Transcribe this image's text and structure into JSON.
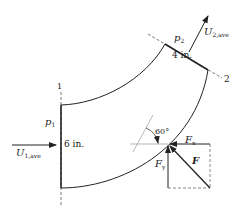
{
  "diagram": {
    "section1_label": "1",
    "section2_label": "2",
    "p1": "p",
    "p1_sub": "1",
    "p2": "p",
    "p2_sub": "2",
    "inlet_dim": "6 in.",
    "outlet_dim": "4 in.",
    "u1": "U",
    "u1_sub": "1,ave",
    "u2": "U",
    "u2_sub": "2,ave",
    "angle": "60°",
    "fx": "F",
    "fx_sub": "x",
    "fy": "F",
    "fy_sub": "y",
    "f": "F"
  },
  "colors": {
    "line": "#222222",
    "dashed": "#555555",
    "thin": "#888888"
  }
}
